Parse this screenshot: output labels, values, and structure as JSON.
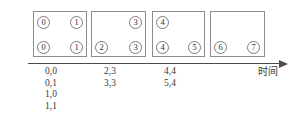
{
  "diagram": {
    "axis": {
      "label": "时间",
      "arrow_icon": "arrow-right-icon",
      "line_color": "#4a4a4a"
    },
    "box_border_color": "#8d8d8d",
    "token_border_color": "#7a7a7a",
    "groups": [
      {
        "id": "group-1",
        "top_tokens": [
          {
            "value": "0",
            "slot": "left"
          },
          {
            "value": "1",
            "slot": "right"
          }
        ],
        "bottom_tokens": [
          {
            "value": "0",
            "slot": "left"
          },
          {
            "value": "1",
            "slot": "right"
          }
        ],
        "labels": [
          "0,0",
          "0,1",
          "1,0",
          "1,1"
        ]
      },
      {
        "id": "group-2",
        "top_tokens": [
          {
            "value": "3",
            "slot": "right"
          }
        ],
        "bottom_tokens": [
          {
            "value": "2",
            "slot": "left"
          },
          {
            "value": "3",
            "slot": "right"
          }
        ],
        "labels": [
          "2,3",
          "3,3"
        ]
      },
      {
        "id": "group-3",
        "top_tokens": [
          {
            "value": "4",
            "slot": "left"
          }
        ],
        "bottom_tokens": [
          {
            "value": "4",
            "slot": "left"
          },
          {
            "value": "5",
            "slot": "right"
          }
        ],
        "labels": [
          "4,4",
          "5,4"
        ]
      },
      {
        "id": "group-4",
        "top_tokens": [],
        "bottom_tokens": [
          {
            "value": "6",
            "slot": "left"
          },
          {
            "value": "7",
            "slot": "right"
          }
        ],
        "labels": []
      }
    ]
  }
}
